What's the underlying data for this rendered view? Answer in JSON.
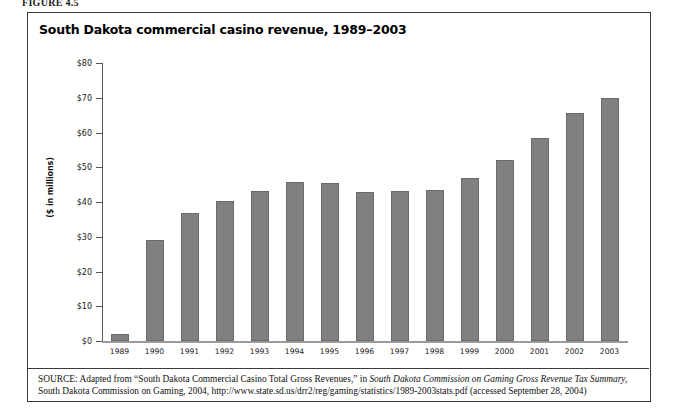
{
  "figure_label": "FIGURE 4.5",
  "chart_title": "South Dakota commercial casino revenue, 1989–2003",
  "axis": {
    "y_title": "($ in millions)",
    "y_ticks": [
      "$80",
      "$70",
      "$60",
      "$50",
      "$40",
      "$30",
      "$20",
      "$10",
      "$0"
    ]
  },
  "source": {
    "prefix": "SOURCE:",
    "text_before_italic": " Adapted from “South Dakota Commercial Casino Total Gross Revenues,” in ",
    "italic_title": "South Dakota Commission on Gaming Gross Revenue Tax Summary,",
    "text_after_italic": " South Dakota Commission on Gaming, 2004, http://www.state.sd.us/drr2/reg/gaming/statistics/1989-2003stats.pdf (accessed September 28, 2004)"
  },
  "colors": {
    "bar_fill": "#808080",
    "bar_edge": "#6b6b6b",
    "frame": "#3a3a3a",
    "axis": "#555555"
  },
  "chart_data": {
    "type": "bar",
    "title": "South Dakota commercial casino revenue, 1989–2003",
    "xlabel": "",
    "ylabel": "($ in millions)",
    "ylim": [
      0,
      80
    ],
    "ytick_values": [
      0,
      10,
      20,
      30,
      40,
      50,
      60,
      70,
      80
    ],
    "grid": false,
    "legend": false,
    "categories": [
      "1989",
      "1990",
      "1991",
      "1992",
      "1993",
      "1994",
      "1995",
      "1996",
      "1997",
      "1998",
      "1999",
      "2000",
      "2001",
      "2002",
      "2003"
    ],
    "values": [
      2.1,
      29.2,
      36.8,
      40.3,
      43.2,
      45.7,
      45.4,
      42.8,
      43.2,
      43.6,
      47.0,
      52.1,
      58.3,
      65.6,
      69.8
    ]
  }
}
